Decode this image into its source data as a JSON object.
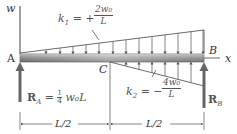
{
  "diagram": {
    "axis_w_label": "w",
    "axis_x_label": "x",
    "point_A": "A",
    "point_B": "B",
    "point_C": "C",
    "k1": {
      "lhs": "k",
      "sub": "1",
      "eq": "= +",
      "num": "2w₀",
      "den": "L"
    },
    "k2": {
      "lhs": "k",
      "sub": "2",
      "eq": "= −",
      "num": "4w₀",
      "den": "L"
    },
    "RA": {
      "label": "R",
      "sub": "A",
      "eq": "= ",
      "coef_num": "1",
      "coef_den": "4",
      "rest": "w₀L"
    },
    "RB": {
      "label": "R",
      "sub": "B"
    },
    "dim_left": "L/2",
    "dim_right": "L/2",
    "colors": {
      "line": "#444444",
      "beam_dark": "#6a6a6a",
      "beam_light": "#c8c8c8",
      "arrow": "#555555"
    }
  }
}
